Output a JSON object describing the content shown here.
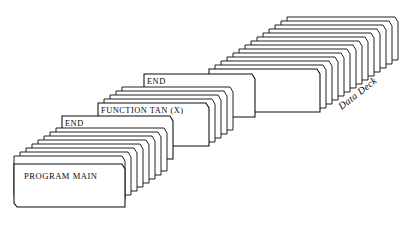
{
  "diagram": {
    "type": "punched-card-deck-illustration",
    "title": "",
    "background_color": "#ffffff",
    "line_color": "#0a0a0a",
    "card_fill_color": "#ffffff",
    "labels": {
      "program_main": "PROGRAM MAIN",
      "end_lower": "END",
      "function_tan": "FUNCTION TAN (X)",
      "end_upper": "END",
      "data_deck": "Data Deck"
    },
    "groups": [
      {
        "name": "main-program-deck",
        "label": "PROGRAM MAIN",
        "card_count": 9,
        "order": 1,
        "description": "front stack of punched cards, first card labeled PROGRAM MAIN"
      },
      {
        "name": "main-program-end-card",
        "label": "END",
        "card_count": 1,
        "order": 2,
        "description": "terminator card for the main program"
      },
      {
        "name": "function-subprogram-deck",
        "label": "FUNCTION TAN (X)",
        "card_count": 5,
        "order": 3,
        "description": "subprogram stack, first card labeled FUNCTION TAN (X)"
      },
      {
        "name": "function-end-card",
        "label": "END",
        "card_count": 1,
        "order": 4,
        "description": "terminator card for the function subprogram"
      },
      {
        "name": "data-deck",
        "label": "Data Deck",
        "card_count": 14,
        "order": 5,
        "description": "rear stack of unlabeled data cards annotated Data Deck"
      }
    ]
  }
}
